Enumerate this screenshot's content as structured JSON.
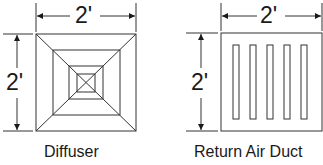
{
  "diagrams": [
    {
      "name": "Diffuser",
      "caption": "Diffuser",
      "width_label": "2'",
      "height_label": "2'"
    },
    {
      "name": "Return Air Duct",
      "caption": "Return Air Duct",
      "width_label": "2'",
      "height_label": "2'",
      "slot_count": 5
    }
  ],
  "colors": {
    "line": "#333333",
    "text": "#1a1a1a",
    "background": "#ffffff"
  }
}
